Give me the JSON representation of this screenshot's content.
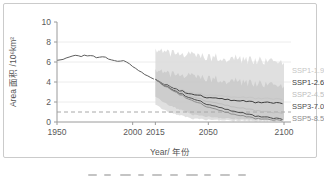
{
  "figure": {
    "border_color": "#cbcbcb",
    "background": "#ffffff"
  },
  "chart_data": {
    "type": "line",
    "title": "",
    "xlabel": "Year/ 年份",
    "ylabel": "Area 面积 /10⁶km²",
    "xlim": [
      1950,
      2100
    ],
    "ylim": [
      0,
      10
    ],
    "xticks": [
      1950,
      2000,
      2015,
      2050,
      2100
    ],
    "yticks": [
      0,
      2,
      4,
      6,
      8,
      10
    ],
    "grid": true,
    "gridline_color": "#ececec",
    "axis_color": "#9a9a9a",
    "tick_label_color": "#595959",
    "threshold_line": {
      "y": 1,
      "style": "dashed",
      "color": "#a8a8a8"
    },
    "projection_start_year": 2015,
    "legend_position": "right-outside",
    "historical": {
      "name": "historical",
      "color": "#5f5f5f",
      "x": [
        1950,
        1953,
        1956,
        1960,
        1963,
        1966,
        1969,
        1972,
        1975,
        1978,
        1981,
        1984,
        1987,
        1990,
        1993,
        1996,
        2000,
        2004,
        2008,
        2012,
        2015
      ],
      "y": [
        6.2,
        6.3,
        6.35,
        6.55,
        6.7,
        6.6,
        6.65,
        6.7,
        6.5,
        6.45,
        6.55,
        6.3,
        6.15,
        6.05,
        6.15,
        5.95,
        5.6,
        5.15,
        4.75,
        4.45,
        4.25
      ],
      "jitter": 0.06
    },
    "bands": [
      {
        "name": "scenario-spread-outer",
        "color": "#dddddd",
        "opacity": 0.9,
        "x": [
          2015,
          2025,
          2040,
          2060,
          2080,
          2100
        ],
        "top": [
          7.1,
          6.9,
          6.6,
          6.4,
          6.2,
          6.1
        ],
        "bottom": [
          1.7,
          0.9,
          0.3,
          0.15,
          0.1,
          0.1
        ],
        "jitter_top": 0.45,
        "jitter_bottom": 0.08
      },
      {
        "name": "scenario-spread-inner",
        "color": "#c9c9c9",
        "opacity": 0.85,
        "x": [
          2015,
          2025,
          2040,
          2060,
          2080,
          2100
        ],
        "top": [
          5.1,
          4.8,
          4.5,
          4.2,
          3.9,
          3.7
        ],
        "bottom": [
          2.5,
          1.6,
          0.7,
          0.35,
          0.25,
          0.2
        ],
        "jitter_top": 0.4,
        "jitter_bottom": 0.07
      }
    ],
    "series": [
      {
        "name": "SSP1-1.9",
        "color": "#c6c6c6",
        "x": [
          2015,
          2020,
          2030,
          2040,
          2050,
          2060,
          2070,
          2080,
          2090,
          2100
        ],
        "y": [
          4.25,
          3.9,
          3.3,
          2.9,
          2.7,
          2.55,
          2.45,
          2.4,
          2.35,
          2.3
        ],
        "jitter": 0.09
      },
      {
        "name": "SSP1-2.6",
        "color": "#3d3d3d",
        "x": [
          2015,
          2020,
          2030,
          2040,
          2050,
          2060,
          2070,
          2080,
          2090,
          2100
        ],
        "y": [
          4.25,
          3.85,
          3.2,
          2.75,
          2.45,
          2.25,
          2.1,
          2.0,
          1.95,
          1.9
        ],
        "jitter": 0.09
      },
      {
        "name": "SSP2-4.5",
        "color": "#bdbdbd",
        "x": [
          2015,
          2020,
          2030,
          2040,
          2050,
          2060,
          2070,
          2080,
          2090,
          2100
        ],
        "y": [
          4.25,
          3.8,
          3.1,
          2.5,
          2.05,
          1.7,
          1.4,
          1.2,
          1.0,
          0.9
        ],
        "jitter": 0.08
      },
      {
        "name": "SSP3-7.0",
        "color": "#4c4c4c",
        "x": [
          2015,
          2020,
          2030,
          2040,
          2050,
          2060,
          2070,
          2080,
          2090,
          2100
        ],
        "y": [
          4.25,
          3.75,
          2.95,
          2.3,
          1.75,
          1.3,
          0.95,
          0.65,
          0.45,
          0.3
        ],
        "jitter": 0.08
      },
      {
        "name": "SSP5-8.5",
        "color": "#8e8e8e",
        "x": [
          2015,
          2020,
          2030,
          2040,
          2050,
          2060,
          2070,
          2080,
          2090,
          2100
        ],
        "y": [
          4.25,
          3.7,
          2.85,
          2.1,
          1.5,
          1.0,
          0.65,
          0.4,
          0.25,
          0.15
        ],
        "jitter": 0.08
      }
    ]
  }
}
